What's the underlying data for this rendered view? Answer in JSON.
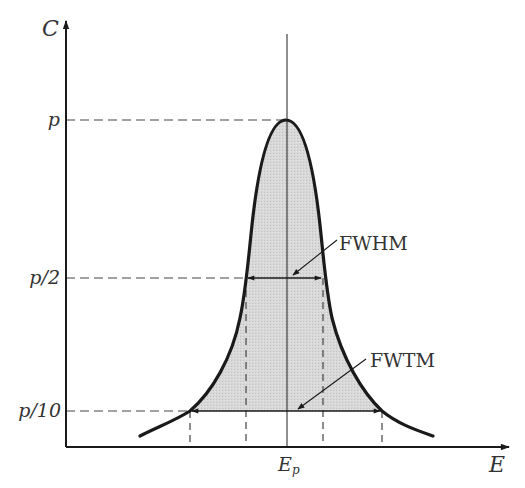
{
  "diagram": {
    "type": "peak-shape",
    "axes": {
      "y_label": "C",
      "x_label": "E",
      "y_ticks": [
        {
          "label": "p",
          "y": 120
        },
        {
          "label": "p/2",
          "y": 278
        },
        {
          "label": "p/10",
          "y": 411
        }
      ],
      "x_ticks": [
        {
          "label": "E",
          "sub": "p",
          "x": 287
        }
      ]
    },
    "annotations": {
      "fwhm": "FWHM",
      "fwtm": "FWTM"
    },
    "colors": {
      "line": "#1a1a1a",
      "fill": "#d4d4d4",
      "text": "#333333",
      "dash": "#444444"
    }
  }
}
